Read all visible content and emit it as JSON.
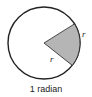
{
  "diagram": {
    "caption": "1 radian",
    "arc_label": "r",
    "radius_label": "r",
    "colors": {
      "circle_stroke": "#222222",
      "sector_fill": "#b5b5b5"
    }
  }
}
